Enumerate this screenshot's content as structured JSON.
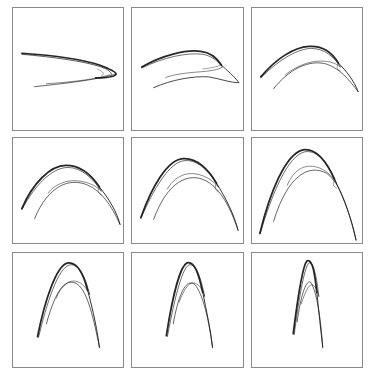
{
  "figure": {
    "frame_color": "#8a8a8a",
    "curve_color": "#1a1a1a",
    "panels": [
      {
        "id": "p1",
        "x": 12,
        "y": 7,
        "w": 112,
        "h": 124,
        "curves": [
          {
            "d": "M9,46 C40,48 70,52 88,58 C96,61 104,64 105,67 C104,70 96,71 84,71",
            "w": 1.6,
            "o": 0.95
          },
          {
            "d": "M9,47 C42,50 72,54 90,60 C98,63 101,66 100,68",
            "w": 0.9,
            "o": 0.8
          },
          {
            "d": "M105,67 C90,72 60,76 22,80",
            "w": 0.8,
            "o": 0.85
          },
          {
            "d": "M98,68 C85,72 65,75 34,77",
            "w": 0.7,
            "o": 0.75
          },
          {
            "d": "M86,62 C92,65 94,67 90,69",
            "w": 0.6,
            "o": 0.7
          }
        ]
      },
      {
        "id": "p2",
        "x": 131,
        "y": 7,
        "w": 113,
        "h": 124,
        "curves": [
          {
            "d": "M10,60 C30,48 55,42 70,44 C80,45 86,50 91,58",
            "w": 1.8,
            "o": 0.95
          },
          {
            "d": "M10,61 C32,50 56,45 72,47 C83,49 89,56 92,60",
            "w": 0.8,
            "o": 0.8
          },
          {
            "d": "M91,58 C96,63 104,69 109,76 C100,76 90,72 78,70 C62,69 40,73 22,81",
            "w": 0.9,
            "o": 0.9
          },
          {
            "d": "M92,60 C88,63 80,64 68,65 C52,66 36,69 34,71",
            "w": 0.7,
            "o": 0.75
          },
          {
            "d": "M90,58 C86,60 80,61 72,62",
            "w": 0.6,
            "o": 0.7
          }
        ]
      },
      {
        "id": "p3",
        "x": 251,
        "y": 7,
        "w": 112,
        "h": 124,
        "curves": [
          {
            "d": "M9,70 C24,52 42,40 58,39 C72,38 82,46 88,56",
            "w": 1.8,
            "o": 0.95
          },
          {
            "d": "M9,71 C26,54 44,42 60,41 C74,41 84,50 90,60",
            "w": 0.8,
            "o": 0.8
          },
          {
            "d": "M88,56 C96,64 104,74 108,85",
            "w": 1.0,
            "o": 0.9
          },
          {
            "d": "M108,85 C98,72 90,62 76,57 C58,52 38,62 22,82",
            "w": 0.8,
            "o": 0.85
          },
          {
            "d": "M90,60 C84,54 70,52 56,56 C44,60 36,66 34,68",
            "w": 0.7,
            "o": 0.75
          },
          {
            "d": "M88,56 C86,60 86,62 90,64",
            "w": 0.6,
            "o": 0.7
          }
        ]
      },
      {
        "id": "p4",
        "x": 12,
        "y": 137,
        "w": 112,
        "h": 107,
        "curves": [
          {
            "d": "M9,72 C20,46 38,28 54,28 C68,28 80,38 88,50",
            "w": 1.8,
            "o": 0.95
          },
          {
            "d": "M9,73 C22,48 40,30 56,30 C70,30 82,42 90,54",
            "w": 0.8,
            "o": 0.8
          },
          {
            "d": "M88,50 C98,62 106,76 109,88",
            "w": 1.0,
            "o": 0.9
          },
          {
            "d": "M109,88 C100,68 90,54 76,48 C58,40 36,48 22,82",
            "w": 0.8,
            "o": 0.85
          },
          {
            "d": "M90,54 C82,46 68,42 56,44 C46,46 38,52 36,56",
            "w": 0.7,
            "o": 0.75
          },
          {
            "d": "M88,50 C86,54 86,56 90,58",
            "w": 0.6,
            "o": 0.7
          }
        ]
      },
      {
        "id": "p5",
        "x": 131,
        "y": 137,
        "w": 113,
        "h": 107,
        "curves": [
          {
            "d": "M9,81 C20,50 36,22 52,21 C66,20 78,32 86,46",
            "w": 1.8,
            "o": 0.95
          },
          {
            "d": "M9,82 C22,52 38,24 54,23 C68,22 80,36 88,50",
            "w": 0.8,
            "o": 0.8
          },
          {
            "d": "M86,46 C96,62 104,78 108,94",
            "w": 1.0,
            "o": 0.9
          },
          {
            "d": "M108,94 C100,70 90,52 76,44 C58,34 36,44 22,83",
            "w": 0.8,
            "o": 0.85
          },
          {
            "d": "M88,50 C80,40 66,34 54,37 C44,40 38,48 36,52",
            "w": 0.7,
            "o": 0.75
          },
          {
            "d": "M86,46 C84,50 84,53 88,55",
            "w": 0.6,
            "o": 0.7
          }
        ]
      },
      {
        "id": "p6",
        "x": 251,
        "y": 137,
        "w": 112,
        "h": 107,
        "curves": [
          {
            "d": "M8,97 C18,56 34,16 52,12 C66,10 76,24 84,42",
            "w": 1.8,
            "o": 0.95
          },
          {
            "d": "M8,98 C20,58 36,18 54,14 C68,12 78,28 86,46",
            "w": 0.8,
            "o": 0.8
          },
          {
            "d": "M84,42 C94,62 102,84 106,104",
            "w": 1.0,
            "o": 0.9
          },
          {
            "d": "M106,104 C98,72 90,46 76,36 C58,26 36,38 22,85",
            "w": 0.8,
            "o": 0.85
          },
          {
            "d": "M86,46 C78,32 64,26 52,30 C44,33 38,42 36,48",
            "w": 0.7,
            "o": 0.75
          },
          {
            "d": "M84,42 C82,46 82,49 86,51",
            "w": 0.6,
            "o": 0.7
          }
        ]
      },
      {
        "id": "p7",
        "x": 12,
        "y": 252,
        "w": 112,
        "h": 116,
        "curves": [
          {
            "d": "M25,85 C32,50 44,12 56,10 C66,9 72,22 76,38",
            "w": 1.8,
            "o": 0.95
          },
          {
            "d": "M26,86 C34,52 46,14 58,12 C68,11 74,26 78,42",
            "w": 0.8,
            "o": 0.8
          },
          {
            "d": "M76,38 C82,60 86,80 88,96",
            "w": 1.0,
            "o": 0.9
          },
          {
            "d": "M88,96 C82,66 76,40 66,32 C54,24 44,36 34,72",
            "w": 0.8,
            "o": 0.85
          },
          {
            "d": "M78,42 C72,30 64,26 56,30 C50,34 46,40 44,46",
            "w": 0.7,
            "o": 0.75
          }
        ]
      },
      {
        "id": "p8",
        "x": 131,
        "y": 252,
        "w": 113,
        "h": 116,
        "curves": [
          {
            "d": "M35,84 C40,52 48,14 56,10 C64,8 68,22 72,40",
            "w": 1.8,
            "o": 0.95
          },
          {
            "d": "M36,85 C42,54 50,16 58,12 C66,11 70,26 74,44",
            "w": 0.8,
            "o": 0.8
          },
          {
            "d": "M72,40 C76,60 80,78 82,96",
            "w": 1.0,
            "o": 0.9
          },
          {
            "d": "M82,96 C78,66 72,42 64,32 C56,26 48,38 42,72",
            "w": 0.8,
            "o": 0.85
          },
          {
            "d": "M74,44 C70,32 64,28 58,32 C54,36 50,44 48,50",
            "w": 0.7,
            "o": 0.75
          }
        ]
      },
      {
        "id": "p9",
        "x": 251,
        "y": 252,
        "w": 112,
        "h": 116,
        "curves": [
          {
            "d": "M42,82 C46,50 52,12 56,8 C62,6 64,22 66,40",
            "w": 1.8,
            "o": 0.95
          },
          {
            "d": "M43,83 C47,52 53,14 58,10 C63,9 66,26 68,44",
            "w": 0.8,
            "o": 0.8
          },
          {
            "d": "M66,40 C68,60 70,78 72,96",
            "w": 1.0,
            "o": 0.9
          },
          {
            "d": "M72,96 C70,66 66,40 60,30 C56,26 50,40 46,70",
            "w": 0.8,
            "o": 0.85
          },
          {
            "d": "M68,44 C66,34 62,30 58,34 C55,38 52,46 50,52",
            "w": 0.7,
            "o": 0.75
          }
        ]
      }
    ]
  }
}
